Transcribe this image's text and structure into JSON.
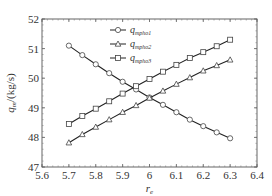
{
  "chart_data": {
    "type": "line",
    "title": "",
    "xlabel": "r_e",
    "ylabel": "q_m/(kg/s)",
    "xlim": [
      5.6,
      6.4
    ],
    "ylim": [
      47,
      52
    ],
    "grid": false,
    "legend_position": "upper center",
    "x_ticks": [
      "5.6",
      "5.7",
      "5.8",
      "5.9",
      "6",
      "6.1",
      "6.2",
      "6.3",
      "6.4"
    ],
    "y_ticks": [
      "47",
      "48",
      "49",
      "50",
      "51",
      "52"
    ],
    "x": [
      5.7,
      5.75,
      5.8,
      5.85,
      5.9,
      5.95,
      6.0,
      6.05,
      6.1,
      6.15,
      6.2,
      6.25,
      6.3
    ],
    "series": [
      {
        "name": "q_mpho1",
        "base": "q",
        "sub": "mpho1",
        "marker": "circle",
        "values": [
          51.1,
          50.78,
          50.47,
          50.17,
          49.88,
          49.62,
          49.35,
          49.1,
          48.85,
          48.6,
          48.38,
          48.17,
          47.97
        ]
      },
      {
        "name": "q_mpho2",
        "base": "q",
        "sub": "mpho2",
        "marker": "triangle",
        "values": [
          47.82,
          48.1,
          48.35,
          48.6,
          48.85,
          49.08,
          49.33,
          49.57,
          49.8,
          50.02,
          50.25,
          50.43,
          50.62
        ]
      },
      {
        "name": "q_mpho3",
        "base": "q",
        "sub": "mpho3",
        "marker": "square",
        "values": [
          48.45,
          48.72,
          48.97,
          49.22,
          49.48,
          49.73,
          49.97,
          50.22,
          50.45,
          50.68,
          50.88,
          51.08,
          51.3
        ]
      }
    ]
  }
}
